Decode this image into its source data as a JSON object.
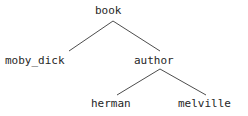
{
  "diagram": {
    "type": "tree",
    "background_color": "#ffffff",
    "text_color": "#262626",
    "edge_color": "#4d4d4d",
    "nodes": [
      {
        "id": "book",
        "label": "book",
        "level": 0,
        "x": 113,
        "y": 11
      },
      {
        "id": "moby_dick",
        "label": "moby_dick",
        "level": 1,
        "x": 42,
        "y": 61
      },
      {
        "id": "author",
        "label": "author",
        "level": 1,
        "x": 160,
        "y": 61
      },
      {
        "id": "herman",
        "label": "herman",
        "level": 2,
        "x": 117,
        "y": 104
      },
      {
        "id": "melville",
        "label": "melville",
        "level": 2,
        "x": 212,
        "y": 104
      }
    ],
    "edges": [
      {
        "from": "book",
        "to": "moby_dick",
        "x1": 113,
        "y1": 21,
        "x2": 69,
        "y2": 51
      },
      {
        "from": "book",
        "to": "author",
        "x1": 113,
        "y1": 21,
        "x2": 160,
        "y2": 51
      },
      {
        "from": "author",
        "to": "herman",
        "x1": 160,
        "y1": 69,
        "x2": 117,
        "y2": 95
      },
      {
        "from": "author",
        "to": "melville",
        "x1": 160,
        "y1": 69,
        "x2": 206,
        "y2": 95
      }
    ]
  },
  "labels": {
    "root": "book",
    "child_left": "moby_dick",
    "child_right": "author",
    "grandchild_left": "herman",
    "grandchild_right": "melville"
  }
}
